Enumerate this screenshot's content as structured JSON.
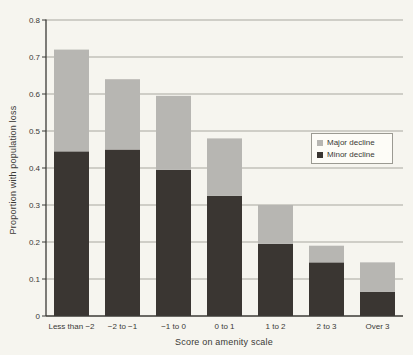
{
  "chart_data": {
    "type": "bar",
    "stacked": true,
    "title": "",
    "xlabel": "Score on amenity scale",
    "ylabel": "Proportion with population loss",
    "categories": [
      "Less than −2",
      "−2 to −1",
      "−1 to 0",
      "0 to 1",
      "1 to 2",
      "2 to 3",
      "Over 3"
    ],
    "series": [
      {
        "name": "Minor decline",
        "color": "#3a3632",
        "values": [
          0.445,
          0.45,
          0.395,
          0.325,
          0.195,
          0.145,
          0.065
        ]
      },
      {
        "name": "Major decline",
        "color": "#b7b6b2",
        "values": [
          0.275,
          0.19,
          0.2,
          0.155,
          0.105,
          0.045,
          0.08
        ]
      }
    ],
    "stack_totals": [
      0.72,
      0.64,
      0.595,
      0.48,
      0.3,
      0.19,
      0.145
    ],
    "ylim": [
      0,
      0.8
    ],
    "y_ticks": [
      "0",
      "0.1",
      "0.2",
      "0.3",
      "0.4",
      "0.5",
      "0.6",
      "0.7",
      "0.8"
    ],
    "grid": true,
    "legend": {
      "position": "middle-right",
      "items": [
        {
          "label": "Major decline",
          "color": "#b7b6b2"
        },
        {
          "label": "Minor decline",
          "color": "#3a3632"
        }
      ]
    }
  },
  "colors": {
    "background": "#f6f5ef",
    "grid": "#a8a79f",
    "axis": "#3b3a36",
    "text": "#3a3936",
    "legend_border": "#9b9a92",
    "legend_bg": "#fdfcf7"
  }
}
